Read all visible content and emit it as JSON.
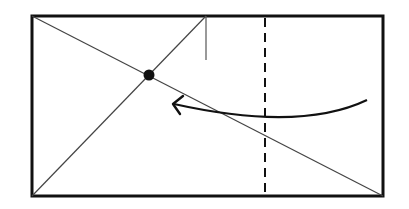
{
  "diagram": {
    "type": "origami-fold-instruction",
    "colors": {
      "line": "#111111",
      "thin_line": "#444444",
      "background": "#ffffff"
    },
    "paper": {
      "x": 32,
      "y": 16,
      "width": 351,
      "height": 180
    },
    "diagonal_main": {
      "x1": 32,
      "y1": 16,
      "x2": 383,
      "y2": 196
    },
    "diagonal_second": {
      "x1": 32,
      "y1": 196,
      "x2": 206,
      "y2": 16
    },
    "crease_mark": {
      "x1": 206,
      "y1": 16,
      "x2": 206,
      "y2": 60
    },
    "valley_fold_line": {
      "x": 265,
      "y1": 16,
      "y2": 196,
      "dash": "9,6"
    },
    "reference_point": {
      "cx": 149,
      "cy": 75,
      "r": 5
    },
    "fold_arrow": {
      "start": [
        367,
        100
      ],
      "control": [
        300,
        132
      ],
      "end": [
        173,
        104
      ],
      "direction": "left"
    }
  }
}
